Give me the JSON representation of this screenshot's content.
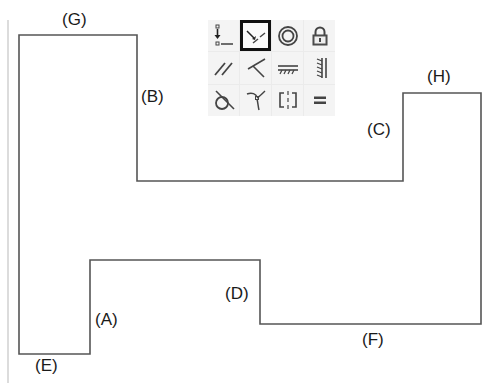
{
  "diagram": {
    "outline_color": "#555555",
    "guide_color": "#d0d0d0",
    "outline_points": [
      [
        19,
        35
      ],
      [
        137,
        35
      ],
      [
        137,
        181
      ],
      [
        403,
        181
      ],
      [
        403,
        93
      ],
      [
        481,
        93
      ],
      [
        481,
        324
      ],
      [
        260,
        324
      ],
      [
        260,
        260
      ],
      [
        90,
        260
      ],
      [
        90,
        354
      ],
      [
        19,
        354
      ]
    ],
    "guide_line": {
      "x": 8,
      "y1": 20,
      "y2": 383
    },
    "labels": [
      {
        "id": "G",
        "text": "(G)",
        "x": 62,
        "y": 11
      },
      {
        "id": "B",
        "text": "(B)",
        "x": 141,
        "y": 88
      },
      {
        "id": "C",
        "text": "(C)",
        "x": 367,
        "y": 121
      },
      {
        "id": "H",
        "text": "(H)",
        "x": 427,
        "y": 68
      },
      {
        "id": "D",
        "text": "(D)",
        "x": 225,
        "y": 285
      },
      {
        "id": "F",
        "text": "(F)",
        "x": 362,
        "y": 331
      },
      {
        "id": "A",
        "text": "(A)",
        "x": 95,
        "y": 311
      },
      {
        "id": "E",
        "text": "(E)",
        "x": 35,
        "y": 357
      }
    ]
  },
  "toolbar": {
    "selected_index": 1,
    "buttons": [
      {
        "icon": "coincident-icon",
        "name": "coincident"
      },
      {
        "icon": "midpoint-icon",
        "name": "midpoint"
      },
      {
        "icon": "concentric-icon",
        "name": "concentric"
      },
      {
        "icon": "lock-icon",
        "name": "fix"
      },
      {
        "icon": "parallel-icon",
        "name": "parallel"
      },
      {
        "icon": "perpendicular-icon",
        "name": "perpendicular"
      },
      {
        "icon": "horizontal-icon",
        "name": "horizontal"
      },
      {
        "icon": "vertical-icon",
        "name": "vertical"
      },
      {
        "icon": "tangent-icon",
        "name": "tangent"
      },
      {
        "icon": "smooth-icon",
        "name": "smooth"
      },
      {
        "icon": "symmetric-icon",
        "name": "symmetric"
      },
      {
        "icon": "equal-icon",
        "name": "equal"
      }
    ]
  }
}
